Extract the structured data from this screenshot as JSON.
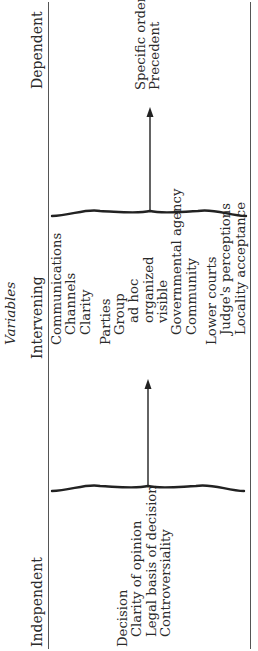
{
  "diagram": {
    "title": "Variables",
    "columns": {
      "independent": {
        "heading": "Independent",
        "items": [
          {
            "label": "Decision",
            "level": 0
          },
          {
            "label": "Clarity of opinion",
            "level": 1
          },
          {
            "label": "Legal basis of decision",
            "level": 1
          },
          {
            "label": "Controversiality",
            "level": 1
          }
        ]
      },
      "intervening": {
        "heading": "Intervening",
        "groups": [
          {
            "label": "Communications",
            "children": [
              "Channels",
              "Clarity"
            ]
          },
          {
            "label": "Parties",
            "children": [
              "Group",
              "ad hoc",
              "organized",
              "visible",
              "Governmental agency",
              "Community"
            ]
          },
          {
            "label": "Lower courts",
            "children": [
              "Judge's perceptions",
              "Locality acceptance"
            ]
          }
        ]
      },
      "dependent": {
        "heading": "Dependent",
        "items": [
          "Specific order",
          "Precedent"
        ]
      }
    },
    "connectors": [
      {
        "from": "independent",
        "to": "intervening",
        "type": "brace-arrow"
      },
      {
        "from": "intervening",
        "to": "dependent",
        "type": "brace-arrow"
      }
    ],
    "line_color": "#555555",
    "text_color": "#2a2a2a"
  }
}
